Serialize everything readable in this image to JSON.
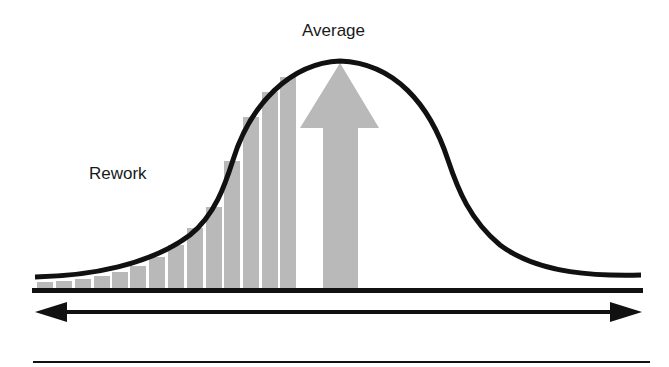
{
  "labels": {
    "average": "Average",
    "rework": "Rework"
  },
  "colors": {
    "curve": "#111111",
    "bars": "#b9b9b9",
    "arrow": "#b9b9b9",
    "lines": "#111111",
    "background": "#ffffff"
  },
  "bars": [
    {
      "x": 37,
      "top": 282
    },
    {
      "x": 56,
      "top": 281
    },
    {
      "x": 75,
      "top": 279
    },
    {
      "x": 94,
      "top": 276
    },
    {
      "x": 112,
      "top": 272
    },
    {
      "x": 130,
      "top": 266
    },
    {
      "x": 149,
      "top": 257
    },
    {
      "x": 168,
      "top": 245
    },
    {
      "x": 187,
      "top": 228
    },
    {
      "x": 206,
      "top": 207
    },
    {
      "x": 224,
      "top": 161
    },
    {
      "x": 243,
      "top": 117
    },
    {
      "x": 262,
      "top": 92
    },
    {
      "x": 280,
      "top": 77
    }
  ],
  "bar_width": 16,
  "baseline_y": 288
}
